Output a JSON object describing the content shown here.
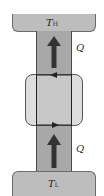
{
  "diagram": {
    "hot_reservoir": {
      "symbol": "T",
      "subscript": "H"
    },
    "cold_reservoir": {
      "symbol": "T",
      "subscript": "L"
    },
    "heat_flow_upper": {
      "label": "Q",
      "direction": "up"
    },
    "heat_flow_lower": {
      "label": "Q",
      "direction": "up"
    },
    "device": {
      "loop_direction": "counterclockwise"
    }
  },
  "colors": {
    "reservoir": "#bdbdbd",
    "conductor": "#a8a8a8",
    "arrow": "#333333"
  }
}
